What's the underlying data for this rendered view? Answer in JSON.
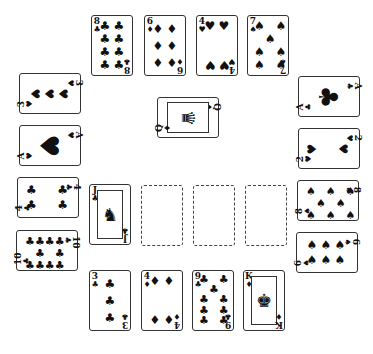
{
  "game": {
    "type": "solitaire-layout",
    "top_row": [
      {
        "rank": "8",
        "suit": "♣",
        "suit_name": "clubs",
        "pips": 8
      },
      {
        "rank": "6",
        "suit": "♦",
        "suit_name": "diamonds",
        "pips": 6
      },
      {
        "rank": "4",
        "suit": "♥",
        "suit_name": "hearts",
        "pips": 4
      },
      {
        "rank": "7",
        "suit": "♠",
        "suit_name": "spades",
        "pips": 7
      }
    ],
    "left_column": [
      {
        "rank": "3",
        "suit": "♥",
        "suit_name": "hearts",
        "pips": 3
      },
      {
        "rank": "A",
        "suit": "♥",
        "suit_name": "hearts",
        "pips": 1
      },
      {
        "rank": "4",
        "suit": "♣",
        "suit_name": "clubs",
        "pips": 4
      },
      {
        "rank": "10",
        "suit": "♣",
        "suit_name": "clubs",
        "pips": 10
      }
    ],
    "right_column": [
      {
        "rank": "A",
        "suit": "♣",
        "suit_name": "clubs",
        "pips": 1
      },
      {
        "rank": "2",
        "suit": "♥",
        "suit_name": "hearts",
        "pips": 2
      },
      {
        "rank": "8",
        "suit": "♠",
        "suit_name": "spades",
        "pips": 8
      },
      {
        "rank": "6",
        "suit": "♠",
        "suit_name": "spades",
        "pips": 6
      }
    ],
    "center_card": {
      "rank": "Q",
      "suit": "♦",
      "suit_name": "diamonds",
      "face": "♛"
    },
    "middle_row": {
      "card": {
        "rank": "J",
        "suit": "♣",
        "suit_name": "clubs",
        "face": "♞"
      },
      "empty_slots": 3
    },
    "bottom_row": [
      {
        "rank": "3",
        "suit": "♣",
        "suit_name": "clubs",
        "pips": 3
      },
      {
        "rank": "4",
        "suit": "♦",
        "suit_name": "diamonds",
        "pips": 4
      },
      {
        "rank": "9",
        "suit": "♣",
        "suit_name": "clubs",
        "pips": 9
      },
      {
        "rank": "K",
        "suit": "♦",
        "suit_name": "diamonds",
        "face": "♚"
      }
    ]
  }
}
